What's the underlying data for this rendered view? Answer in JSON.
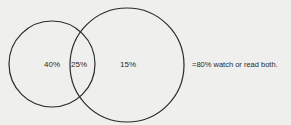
{
  "diagram": {
    "type": "venn",
    "sets": [
      {
        "id": "A",
        "only_label": "40%"
      },
      {
        "id": "B",
        "only_label": "15%"
      }
    ],
    "intersection_label": "25%",
    "summary": "=80% watch or read both.",
    "colors": {
      "stroke": "#2a2a2a",
      "background": "#efefed"
    }
  }
}
